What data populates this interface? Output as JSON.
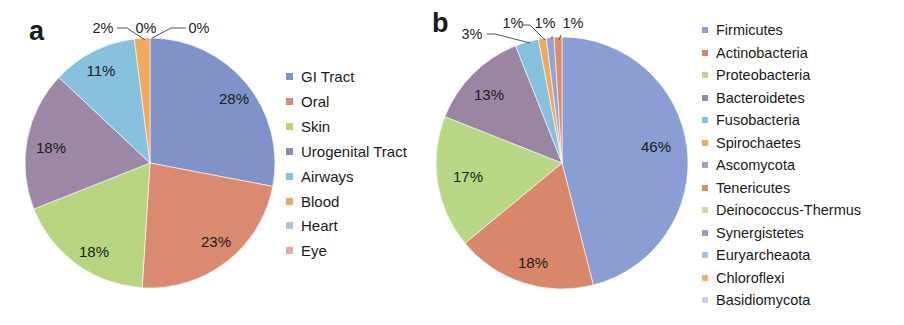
{
  "chart_data": [
    {
      "type": "pie",
      "panel": "a",
      "title": "",
      "categories": [
        "GI Tract",
        "Oral",
        "Skin",
        "Urogenital Tract",
        "Airways",
        "Blood",
        "Heart",
        "Eye"
      ],
      "values": [
        28,
        23,
        18,
        18,
        11,
        2,
        0,
        0
      ],
      "labels": [
        "28%",
        "23%",
        "18%",
        "18%",
        "11%",
        "2%",
        "0%",
        "0%"
      ],
      "colors": [
        "#7f93c8",
        "#d98a70",
        "#b8d47e",
        "#9c88a6",
        "#86c1de",
        "#f1a95a",
        "#b3c1e0",
        "#e9a99a"
      ],
      "start_angle": "12 o'clock",
      "direction": "clockwise",
      "legend_position": "right"
    },
    {
      "type": "pie",
      "panel": "b",
      "title": "",
      "categories": [
        "Firmicutes",
        "Actinobacteria",
        "Proteobacteria",
        "Bacteroidetes",
        "Fusobacteria",
        "Spirochaetes",
        "Ascomycota",
        "Tenericutes",
        "Deinococcus-Thermus",
        "Synergistetes",
        "Euryarcheaota",
        "Chloroflexi",
        "Basidiomycota"
      ],
      "values": [
        46,
        18,
        17,
        13,
        3,
        1,
        1,
        1,
        0,
        0,
        0,
        0,
        0
      ],
      "labels": [
        "46%",
        "18%",
        "17%",
        "13%",
        "3%",
        "1%",
        "1%",
        "1%",
        "",
        "",
        "",
        "",
        ""
      ],
      "colors": [
        "#8a9ed4",
        "#d9876b",
        "#b8d885",
        "#9a86a3",
        "#86c1de",
        "#f1a95a",
        "#94a5d4",
        "#e08a66",
        "#c4df97",
        "#a797b4",
        "#9cc7e6",
        "#f2b06a",
        "#c7d3ea"
      ],
      "start_angle": "12 o'clock",
      "direction": "clockwise",
      "legend_position": "right"
    }
  ],
  "panels": {
    "a": {
      "letter": "a"
    },
    "b": {
      "letter": "b"
    }
  },
  "legend_a": [
    {
      "label": "GI Tract",
      "color": "#7f93c8"
    },
    {
      "label": "Oral",
      "color": "#d98a70"
    },
    {
      "label": "Skin",
      "color": "#b8d47e"
    },
    {
      "label": "Urogenital Tract",
      "color": "#9c88a6"
    },
    {
      "label": "Airways",
      "color": "#86c1de"
    },
    {
      "label": "Blood",
      "color": "#f1a95a"
    },
    {
      "label": "Heart",
      "color": "#b3c1e0"
    },
    {
      "label": "Eye",
      "color": "#e9a99a"
    }
  ],
  "legend_b": [
    {
      "label": "Firmicutes",
      "color": "#8a9ed4"
    },
    {
      "label": "Actinobacteria",
      "color": "#d9876b"
    },
    {
      "label": "Proteobacteria",
      "color": "#b8d885"
    },
    {
      "label": "Bacteroidetes",
      "color": "#9a86a3"
    },
    {
      "label": "Fusobacteria",
      "color": "#86c1de"
    },
    {
      "label": "Spirochaetes",
      "color": "#f1a95a"
    },
    {
      "label": "Ascomycota",
      "color": "#94a5d4"
    },
    {
      "label": "Tenericutes",
      "color": "#e08a66"
    },
    {
      "label": "Deinococcus-Thermus",
      "color": "#c4df97"
    },
    {
      "label": "Synergistetes",
      "color": "#a797b4"
    },
    {
      "label": "Euryarcheaota",
      "color": "#9cc7e6"
    },
    {
      "label": "Chloroflexi",
      "color": "#f2b06a"
    },
    {
      "label": "Basidiomycota",
      "color": "#c7d3ea"
    }
  ]
}
